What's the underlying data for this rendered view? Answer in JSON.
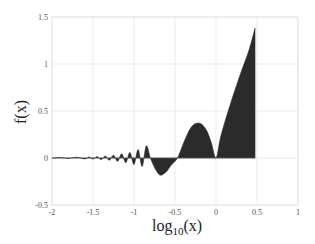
{
  "chart_data": {
    "type": "area",
    "title": "",
    "xlabel": "log10(x)",
    "xlabel_main": "log",
    "xlabel_sub": "10",
    "xlabel_tail": "(x)",
    "ylabel": "f(x)",
    "xlim": [
      -2,
      1
    ],
    "ylim": [
      -0.5,
      1.5
    ],
    "xticks": [
      -2,
      -1.5,
      -1,
      -0.5,
      0,
      0.5,
      1
    ],
    "xtick_labels": [
      "-2",
      "-1.5",
      "-1",
      "-0.5",
      "0",
      "0.5",
      "1"
    ],
    "yticks": [
      -0.5,
      0,
      0.5,
      1,
      1.5
    ],
    "ytick_labels": [
      "-0.5",
      "0",
      "0.5",
      "1",
      "1.5"
    ],
    "grid": true,
    "legend": null,
    "fill_color": "#2b2b2b",
    "grid_color": "#e3e3e3",
    "series": [
      {
        "name": "f(x)",
        "x": [
          -2.0,
          -1.9,
          -1.8,
          -1.7,
          -1.6,
          -1.55,
          -1.5,
          -1.45,
          -1.4,
          -1.35,
          -1.3,
          -1.25,
          -1.2,
          -1.15,
          -1.1,
          -1.05,
          -1.0,
          -0.95,
          -0.9,
          -0.85,
          -0.8,
          -0.75,
          -0.7,
          -0.66,
          -0.6,
          -0.55,
          -0.47,
          -0.4,
          -0.3,
          -0.2,
          -0.12,
          -0.06,
          0.0,
          0.05,
          0.1,
          0.2,
          0.3,
          0.4,
          0.476
        ],
        "y": [
          0.0,
          0.005,
          -0.005,
          0.008,
          -0.01,
          0.012,
          -0.012,
          0.015,
          -0.018,
          0.02,
          -0.025,
          0.03,
          -0.035,
          0.045,
          -0.05,
          0.06,
          -0.07,
          0.09,
          -0.09,
          0.13,
          0.0,
          -0.1,
          -0.17,
          -0.18,
          -0.14,
          -0.08,
          0.0,
          0.15,
          0.33,
          0.37,
          0.3,
          0.17,
          0.0,
          0.2,
          0.36,
          0.64,
          0.9,
          1.14,
          1.38
        ]
      }
    ]
  }
}
